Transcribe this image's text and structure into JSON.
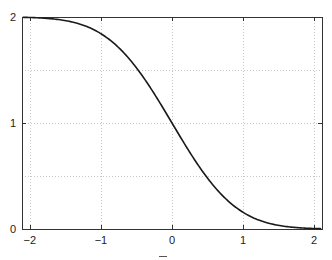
{
  "chart_data": {
    "type": "line",
    "title": "",
    "xlabel": "",
    "ylabel": "",
    "xlim": [
      -2.11,
      2.11
    ],
    "ylim": [
      0,
      2
    ],
    "grid": true,
    "legend": null,
    "x_ticks": [
      -2,
      -1,
      0,
      1,
      2
    ],
    "x_tick_labels": [
      "−2",
      "−1",
      "0",
      "1",
      "2"
    ],
    "y_ticks": [
      0,
      1,
      2
    ],
    "y_tick_labels": [
      "0",
      "1",
      "2"
    ],
    "y_grid": [
      0.5,
      1,
      1.5
    ],
    "series": [
      {
        "name": "erfc(x)",
        "color": "#1a1a1a",
        "x": [
          -2.1,
          -2.0,
          -1.75,
          -1.5,
          -1.25,
          -1.0,
          -0.75,
          -0.5,
          -0.25,
          0,
          0.25,
          0.5,
          0.75,
          1.0,
          1.25,
          1.5,
          1.75,
          2.0,
          2.1
        ],
        "y": [
          1.997,
          1.995,
          1.987,
          1.966,
          1.923,
          1.843,
          1.711,
          1.52,
          1.276,
          1.0,
          0.724,
          0.48,
          0.289,
          0.157,
          0.077,
          0.034,
          0.013,
          0.005,
          0.003
        ]
      }
    ]
  },
  "plot": {
    "left": 22,
    "right": 322,
    "top": 17,
    "bottom": 229
  }
}
